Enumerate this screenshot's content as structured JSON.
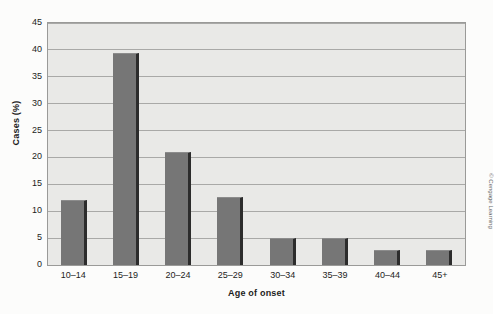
{
  "chart_data": {
    "type": "bar",
    "title": "",
    "xlabel": "Age of onset",
    "ylabel": "Cases (%)",
    "categories": [
      "10–14",
      "15–19",
      "20–24",
      "25–29",
      "30–34",
      "35–39",
      "40–44",
      "45+"
    ],
    "values": [
      12.0,
      39.5,
      21.0,
      12.7,
      5.0,
      5.0,
      2.7,
      2.7
    ],
    "ylim": [
      0,
      45
    ],
    "yticks": [
      0,
      5,
      10,
      15,
      20,
      25,
      30,
      35,
      40,
      45
    ],
    "grid": true,
    "legend": false,
    "bar_color": "#767676",
    "bar_edge_color": "#2c2c2c",
    "plot_background": "#e9e9e7",
    "gridline_color": "#a9a9a7"
  },
  "credit": {
    "text": "© Cengage Learning"
  }
}
